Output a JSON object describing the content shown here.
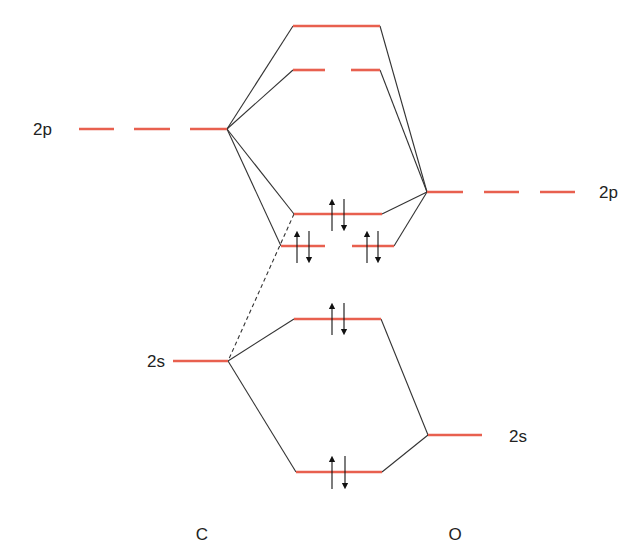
{
  "diagram": {
    "type": "molecular-orbital-diagram",
    "colors": {
      "orbital_level": "#e8604f",
      "connector": "#333333",
      "arrow": "#111111",
      "text": "#222222"
    },
    "atoms": {
      "left": {
        "label": "C",
        "x": 202,
        "y": 540
      },
      "right": {
        "label": "O",
        "x": 455,
        "y": 540
      }
    },
    "orbital_labels": [
      {
        "id": "c-2p-label",
        "text": "2p",
        "x": 33,
        "y": 135
      },
      {
        "id": "c-2s-label",
        "text": "2s",
        "x": 147,
        "y": 367
      },
      {
        "id": "o-2p-label",
        "text": "2p",
        "x": 599,
        "y": 198
      },
      {
        "id": "o-2s-label",
        "text": "2s",
        "x": 509,
        "y": 442
      }
    ],
    "levels": [
      {
        "id": "c-2p",
        "segments": [
          [
            79,
            114
          ],
          [
            134,
            170
          ],
          [
            190,
            227
          ]
        ],
        "y": 129
      },
      {
        "id": "c-2s",
        "segments": [
          [
            173,
            228
          ]
        ],
        "y": 361
      },
      {
        "id": "o-2p",
        "segments": [
          [
            427,
            463
          ],
          [
            484,
            519
          ],
          [
            540,
            575
          ]
        ],
        "y": 192
      },
      {
        "id": "o-2s",
        "segments": [
          [
            428,
            482
          ]
        ],
        "y": 435
      },
      {
        "id": "mo-sigma-star-2p",
        "segments": [
          [
            293,
            380
          ]
        ],
        "y": 26
      },
      {
        "id": "mo-pi-star-2p",
        "segments": [
          [
            293,
            325
          ],
          [
            351,
            380
          ]
        ],
        "y": 70
      },
      {
        "id": "mo-sigma-2p",
        "segments": [
          [
            294,
            382
          ]
        ],
        "y": 214
      },
      {
        "id": "mo-pi-2p",
        "segments": [
          [
            281,
            325
          ],
          [
            352,
            394
          ]
        ],
        "y": 246
      },
      {
        "id": "mo-sigma-star-2s",
        "segments": [
          [
            294,
            381
          ]
        ],
        "y": 319
      },
      {
        "id": "mo-sigma-2s",
        "segments": [
          [
            296,
            382
          ]
        ],
        "y": 472
      }
    ],
    "connectors": [
      {
        "from": [
          227,
          129
        ],
        "to": [
          293,
          26
        ]
      },
      {
        "from": [
          227,
          129
        ],
        "to": [
          293,
          70
        ]
      },
      {
        "from": [
          227,
          129
        ],
        "to": [
          294,
          214
        ]
      },
      {
        "from": [
          227,
          129
        ],
        "to": [
          281,
          246
        ]
      },
      {
        "from": [
          427,
          192
        ],
        "to": [
          380,
          26
        ]
      },
      {
        "from": [
          427,
          192
        ],
        "to": [
          380,
          70
        ]
      },
      {
        "from": [
          427,
          192
        ],
        "to": [
          382,
          214
        ]
      },
      {
        "from": [
          427,
          192
        ],
        "to": [
          394,
          246
        ]
      },
      {
        "from": [
          228,
          361
        ],
        "to": [
          294,
          319
        ]
      },
      {
        "from": [
          228,
          361
        ],
        "to": [
          296,
          472
        ]
      },
      {
        "from": [
          428,
          435
        ],
        "to": [
          381,
          319
        ]
      },
      {
        "from": [
          428,
          435
        ],
        "to": [
          382,
          472
        ]
      }
    ],
    "dashed_connectors": [
      {
        "from": [
          294,
          214
        ],
        "to": [
          228,
          361
        ]
      }
    ],
    "electron_pairs": [
      {
        "level": "mo-sigma-2p",
        "up_x": 332,
        "down_x": 344,
        "y_top": 199,
        "y_bottom": 231
      },
      {
        "level": "mo-pi-2p-a",
        "up_x": 297,
        "down_x": 309,
        "y_top": 231,
        "y_bottom": 263
      },
      {
        "level": "mo-pi-2p-b",
        "up_x": 367,
        "down_x": 378,
        "y_top": 231,
        "y_bottom": 263
      },
      {
        "level": "mo-sigma-star-2s",
        "up_x": 332,
        "down_x": 344,
        "y_top": 303,
        "y_bottom": 335
      },
      {
        "level": "mo-sigma-2s",
        "up_x": 332,
        "down_x": 345,
        "y_top": 456,
        "y_bottom": 489
      }
    ]
  }
}
